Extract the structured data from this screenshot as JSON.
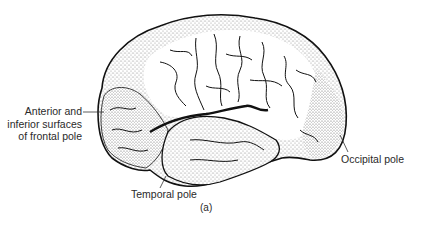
{
  "figure": {
    "caption": "(a)",
    "labels": {
      "frontal": [
        "Anterior and",
        "inferior surfaces",
        "of frontal pole"
      ],
      "occipital": "Occipital pole",
      "temporal": "Temporal pole"
    },
    "colors": {
      "outline": "#111111",
      "stipple": "#9a9a9a",
      "background": "#ffffff"
    }
  }
}
